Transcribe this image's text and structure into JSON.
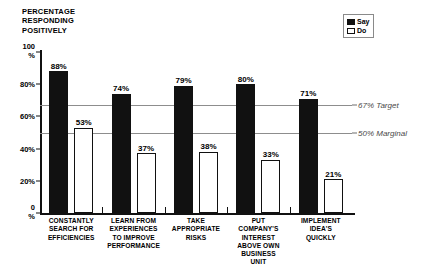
{
  "chart_data": {
    "type": "bar",
    "title": "PERCENTAGE\nRESPONDING\nPOSITIVELY",
    "xlabel": "",
    "ylabel": "",
    "ylim": [
      0,
      100
    ],
    "grid": false,
    "legend_position": "top-right",
    "categories": [
      "CONSTANTLY\nSEARCH FOR\nEFFICIENCIES",
      "LEARN FROM\nEXPERIENCES\nTO IMPROVE\nPERFORMANCE",
      "TAKE\nAPPROPRIATE\nRISKS",
      "PUT\nCOMPANY'S\nINTEREST\nABOVE OWN\nBUSINESS\nUNIT",
      "IMPLEMENT\nIDEA'S\nQUICKLY"
    ],
    "series": [
      {
        "name": "Say",
        "color": "#111111",
        "values": [
          88,
          74,
          79,
          80,
          71
        ],
        "labels": [
          "88%",
          "74%",
          "79%",
          "80%",
          "71%"
        ]
      },
      {
        "name": "Do",
        "color": "#ffffff",
        "values": [
          53,
          37,
          38,
          33,
          21
        ],
        "labels": [
          "53%",
          "37%",
          "38%",
          "33%",
          "21%"
        ]
      }
    ],
    "yticks": [
      {
        "value": 100,
        "label": "100\n%"
      },
      {
        "value": 80,
        "label": "80%"
      },
      {
        "value": 60,
        "label": "60%"
      },
      {
        "value": 40,
        "label": "40%"
      },
      {
        "value": 20,
        "label": "20%"
      },
      {
        "value": 0,
        "label": "0\n%"
      }
    ],
    "reference_lines": [
      {
        "value": 67,
        "label": "67% Target"
      },
      {
        "value": 50,
        "label": "50% Marginal"
      }
    ]
  },
  "legend": {
    "items": [
      {
        "label": "Say"
      },
      {
        "label": "Do"
      }
    ]
  }
}
